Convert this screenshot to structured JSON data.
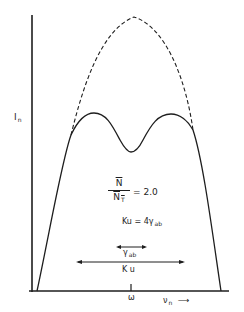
{
  "figure": {
    "y_axis_label": "I",
    "y_axis_label_sub": "n",
    "x_axis_label": "ν",
    "x_axis_label_sub": "n",
    "x_axis_arrow": "⟶",
    "center_tick_label": "ω",
    "ratio": {
      "numerator": "N",
      "denominator": "N",
      "denominator_sub": "T",
      "equals": "= 2.0"
    },
    "relation": {
      "lhs": "Ku = 4",
      "gamma": "γ",
      "gamma_sub": "ab"
    },
    "gamma_arrow_label": "γ",
    "gamma_arrow_label_sub": "ab",
    "ku_arrow_label": "K u",
    "curves": {
      "dashed": "Gaussian (Doppler) profile",
      "solid": "Profile with hole burned at center"
    },
    "colors": {
      "ink": "#1e1e1e",
      "background": "#ffffff"
    }
  }
}
